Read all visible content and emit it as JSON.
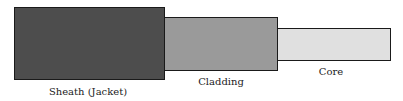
{
  "diagram": {
    "layers": [
      {
        "id": "sheath",
        "label": "Sheath (Jacket)",
        "color": "#4d4d4d"
      },
      {
        "id": "cladding",
        "label": "Cladding",
        "color": "#9a9a9a"
      },
      {
        "id": "core",
        "label": "Core",
        "color": "#e0e0e0"
      }
    ]
  }
}
